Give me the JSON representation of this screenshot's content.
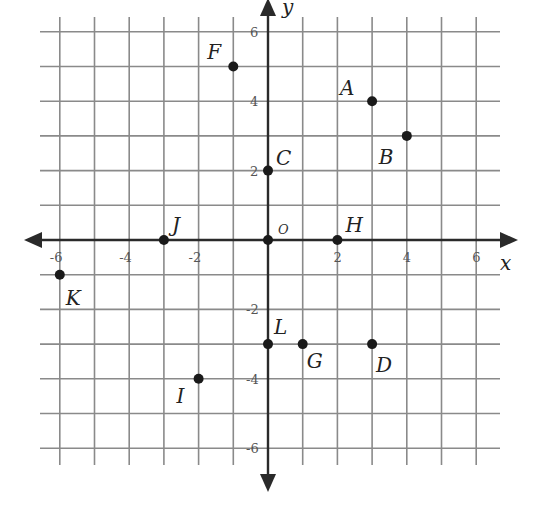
{
  "figure": {
    "x_axis_label": "x",
    "y_axis_label": "y",
    "origin_label": "O",
    "x_range": [
      -6,
      6
    ],
    "y_range": [
      -6,
      6
    ],
    "grid_step": 1,
    "x_tick_labels": [
      "-6",
      "-4",
      "-2",
      "2",
      "4",
      "6"
    ],
    "y_tick_labels": [
      "6",
      "4",
      "2",
      "-2",
      "-4",
      "-6"
    ],
    "colors": {
      "grid": "#8a8a8a",
      "axis": "#2a2a2a",
      "point": "#1a1a1a",
      "background": "#ffffff"
    }
  },
  "chart_data": {
    "type": "scatter",
    "title": "",
    "xlabel": "x",
    "ylabel": "y",
    "xlim": [
      -6,
      6
    ],
    "ylim": [
      -6,
      6
    ],
    "grid": true,
    "x_ticks": [
      -6,
      -4,
      -2,
      2,
      4,
      6
    ],
    "y_ticks": [
      -6,
      -4,
      -2,
      2,
      4,
      6
    ],
    "points": [
      {
        "label": "A",
        "x": 3,
        "y": 4
      },
      {
        "label": "B",
        "x": 4,
        "y": 3
      },
      {
        "label": "C",
        "x": 0,
        "y": 2
      },
      {
        "label": "D",
        "x": 3,
        "y": -3
      },
      {
        "label": "F",
        "x": -1,
        "y": 5
      },
      {
        "label": "G",
        "x": 1,
        "y": -3
      },
      {
        "label": "H",
        "x": 2,
        "y": 0
      },
      {
        "label": "I",
        "x": -2,
        "y": -4
      },
      {
        "label": "J",
        "x": -3,
        "y": 0
      },
      {
        "label": "K",
        "x": -6,
        "y": -1
      },
      {
        "label": "L",
        "x": 0,
        "y": -3
      },
      {
        "label": "O",
        "x": 0,
        "y": 0
      }
    ]
  }
}
